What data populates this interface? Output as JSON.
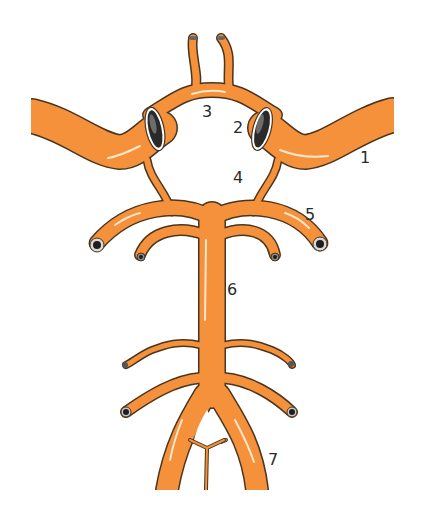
{
  "diagram": {
    "colors": {
      "vessel": "#f5913a",
      "outline": "#4a3520",
      "highlight": "#fde6cc",
      "lumen_dark": "#1e1e1e",
      "lumen_rim": "#d8d8d8"
    },
    "labels": [
      {
        "id": "1",
        "text": "1",
        "x": 360,
        "y": 150
      },
      {
        "id": "2",
        "text": "2",
        "x": 233,
        "y": 120
      },
      {
        "id": "3",
        "text": "3",
        "x": 202,
        "y": 104
      },
      {
        "id": "4",
        "text": "4",
        "x": 233,
        "y": 170
      },
      {
        "id": "5",
        "text": "5",
        "x": 305,
        "y": 207
      },
      {
        "id": "6",
        "text": "6",
        "x": 227,
        "y": 282
      },
      {
        "id": "7",
        "text": "7",
        "x": 268,
        "y": 452
      }
    ]
  }
}
